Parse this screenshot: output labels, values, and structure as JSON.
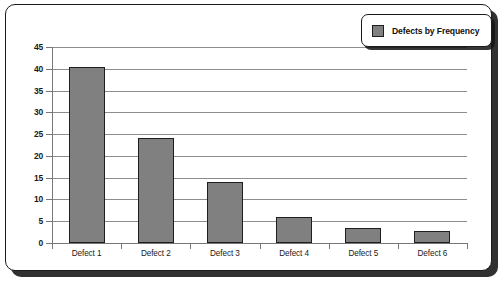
{
  "chart_data": {
    "type": "bar",
    "title": "",
    "xlabel": "",
    "ylabel": "",
    "categories": [
      "Defect 1",
      "Defect 2",
      "Defect 3",
      "Defect 4",
      "Defect 5",
      "Defect 6"
    ],
    "values": [
      40.5,
      24.2,
      14,
      6,
      3.5,
      2.8
    ],
    "series": [
      {
        "name": "Defects by Frequency",
        "values": [
          40.5,
          24.2,
          14,
          6,
          3.5,
          2.8
        ]
      }
    ],
    "ylim": [
      0,
      45
    ],
    "ytick_labels": [
      "0",
      "5",
      "10",
      "15",
      "20",
      "25",
      "30",
      "35",
      "40",
      "45"
    ],
    "ytick_values": [
      0,
      5,
      10,
      15,
      20,
      25,
      30,
      35,
      40,
      45
    ],
    "grid": true,
    "legend": {
      "position": "top-right",
      "entries": [
        {
          "label": "Defects by Frequency",
          "color": "#808080"
        }
      ]
    },
    "colors": {
      "bar_fill": "#808080",
      "bar_border": "#1e1e1e",
      "gridline": "#8d8d8d",
      "axis": "#777777",
      "frame_border": "#1b1b1b",
      "background": "#ffffff",
      "text": "#1a1a1a"
    }
  }
}
